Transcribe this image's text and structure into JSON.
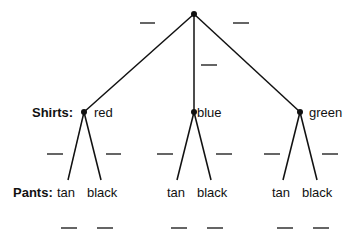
{
  "diagram": {
    "type": "tree",
    "root": {
      "x": 194,
      "y": 14
    },
    "levels": {
      "shirts": {
        "label": "Shirts:",
        "nodes": [
          {
            "name": "red",
            "x": 84,
            "y": 112
          },
          {
            "name": "blue",
            "x": 194,
            "y": 112
          },
          {
            "name": "green",
            "x": 300,
            "y": 112
          }
        ]
      },
      "pants": {
        "label": "Pants:",
        "options": [
          "tan",
          "black"
        ]
      }
    },
    "blanks": "______"
  },
  "labels": {
    "shirts_title": "Shirts:",
    "pants_title": "Pants:",
    "red": "red",
    "blue": "blue",
    "green": "green",
    "tan": "tan",
    "black": "black"
  }
}
